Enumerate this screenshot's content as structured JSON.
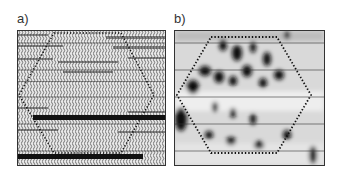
{
  "figure": {
    "panels": [
      {
        "label": "a)",
        "type": "seismic-wiggle-section",
        "overlay": "dotted-hexagon",
        "gridlines": 5
      },
      {
        "label": "b)",
        "type": "seismic-attribute-map",
        "overlay": "dotted-hexagon",
        "gridlines": 5
      }
    ]
  }
}
